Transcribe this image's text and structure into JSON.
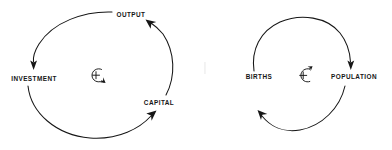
{
  "figure": {
    "type": "causal-loop-diagram-pair",
    "background_color": "#ffffff",
    "ink_color": "#161616",
    "width": 392,
    "height": 150
  },
  "diagrams": [
    {
      "id": "economic-growth-loop",
      "name": "Investment / Output / Capital reinforcing loop",
      "polarity": "+",
      "direction": "clockwise",
      "center_symbol": "plus-circle-clockwise-arrow",
      "nodes": [
        {
          "id": "output",
          "label": "OUTPUT",
          "x": 131,
          "y": 17,
          "anchor": "middle"
        },
        {
          "id": "investment",
          "label": "INVESTMENT",
          "x": 34,
          "y": 81,
          "anchor": "middle"
        },
        {
          "id": "capital",
          "label": "CAPITAL",
          "x": 159,
          "y": 105,
          "anchor": "middle"
        }
      ],
      "links": [
        {
          "from": "output",
          "to": "investment",
          "arrow": "down"
        },
        {
          "from": "investment",
          "to": "capital",
          "arrow": "up-right"
        },
        {
          "from": "capital",
          "to": "output",
          "arrow": "up-left"
        }
      ]
    },
    {
      "id": "population-loop",
      "name": "Births / Population reinforcing loop",
      "polarity": "+",
      "direction": "clockwise",
      "center_symbol": "plus-circle-clockwise-arrow",
      "nodes": [
        {
          "id": "births",
          "x": 259,
          "y": 79,
          "label": "BIRTHS",
          "anchor": "middle"
        },
        {
          "id": "population",
          "x": 354,
          "y": 79,
          "label": "POPULATION",
          "anchor": "middle"
        }
      ],
      "links": [
        {
          "from": "births",
          "to": "population",
          "arrow": "down"
        },
        {
          "from": "population",
          "to": "births",
          "arrow": "up-left"
        }
      ]
    }
  ],
  "labels": {
    "output": "OUTPUT",
    "investment": "INVESTMENT",
    "capital": "CAPITAL",
    "births": "BIRTHS",
    "population": "POPULATION"
  },
  "symbols": {
    "polarity_sign": "+"
  }
}
